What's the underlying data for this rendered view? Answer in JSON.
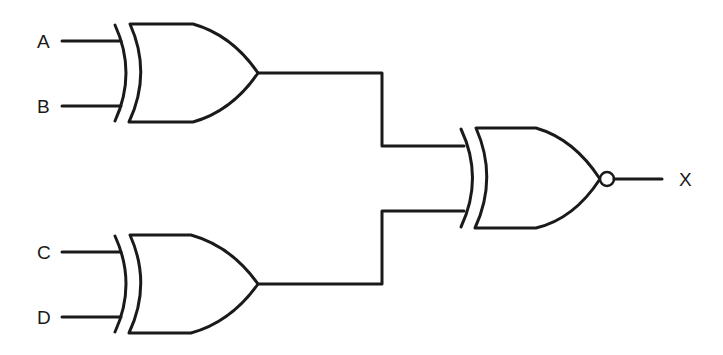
{
  "diagram": {
    "type": "logic-circuit",
    "inputs": [
      {
        "id": "A",
        "label": "A"
      },
      {
        "id": "B",
        "label": "B"
      },
      {
        "id": "C",
        "label": "C"
      },
      {
        "id": "D",
        "label": "D"
      }
    ],
    "output": {
      "id": "X",
      "label": "X"
    },
    "gates": [
      {
        "id": "g1",
        "type": "XOR",
        "inputs": [
          "A",
          "B"
        ]
      },
      {
        "id": "g2",
        "type": "XOR",
        "inputs": [
          "C",
          "D"
        ]
      },
      {
        "id": "g3",
        "type": "XNOR",
        "inputs": [
          "g1",
          "g2"
        ],
        "output": "X"
      }
    ],
    "colors": {
      "stroke": "#1a1a1a",
      "background": "#ffffff"
    }
  }
}
